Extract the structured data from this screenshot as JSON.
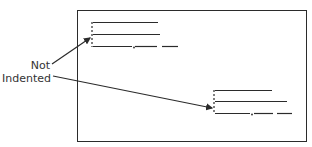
{
  "diagram": {
    "label_line1": "Not",
    "label_line2": "Indented",
    "colors": {
      "ink": "#2b2b2b",
      "background": "#ffffff"
    }
  }
}
